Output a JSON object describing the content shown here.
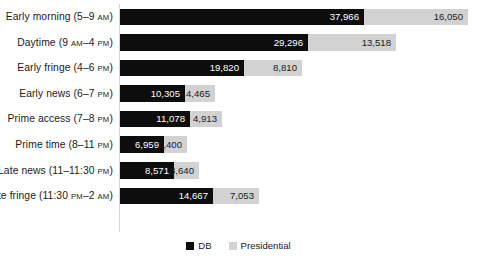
{
  "chart_data": {
    "type": "bar",
    "orientation": "horizontal",
    "stacked": true,
    "title": "",
    "xlabel": "",
    "ylabel": "",
    "grid": false,
    "legend_position": "bottom",
    "categories": [
      "Early morning (5–9 AM)",
      "Daytime (9 AM–4 PM)",
      "Early fringe (4–6 PM)",
      "Early news (6–7 PM)",
      "Prime access (7–8 PM)",
      "Prime time (8–11 PM)",
      "Late news (11–11:30 PM)",
      "Late fringe (11:30 PM–2 AM)"
    ],
    "series": [
      {
        "name": "DB",
        "color": "#0d0d0d",
        "values": [
          37966,
          29296,
          19820,
          10305,
          11078,
          6959,
          8571,
          14667
        ],
        "labels": [
          "37,966",
          "29,296",
          "19,820",
          "10,305",
          "11,078",
          "6,959",
          "8,571",
          "14,667"
        ]
      },
      {
        "name": "Presidential",
        "color": "#d2d2d2",
        "values": [
          16050,
          13518,
          8810,
          4465,
          4913,
          3400,
          3640,
          7053
        ],
        "labels": [
          "16,050",
          "13,518",
          "8,810",
          "4,465",
          "4,913",
          "3,400",
          "3,640",
          "7,053"
        ]
      }
    ],
    "xlim": [
      0,
      56000
    ]
  },
  "rows": [
    {
      "label_main": "Early morning (5–9 ",
      "label_mer": "AM",
      "label_tail": ")",
      "db_label": "37,966",
      "pres_label": "16,050",
      "db_px": 244,
      "pres_px": 104,
      "db_inside": true,
      "pres_inside": true
    },
    {
      "label_main": "Daytime (9 ",
      "label_mer": "AM",
      "label_tail": "–4 ",
      "label_mer2": "PM",
      "label_tail2": ")",
      "db_label": "29,296",
      "pres_label": "13,518",
      "db_px": 188,
      "pres_px": 88,
      "db_inside": true,
      "pres_inside": true
    },
    {
      "label_main": "Early fringe (4–6 ",
      "label_mer": "PM",
      "label_tail": ")",
      "db_label": "19,820",
      "pres_label": "8,810",
      "db_px": 124,
      "pres_px": 58,
      "db_inside": true,
      "pres_inside": true
    },
    {
      "label_main": "Early news (6–7 ",
      "label_mer": "PM",
      "label_tail": ")",
      "db_label": "10,305",
      "pres_label": "4,465",
      "db_px": 65,
      "pres_px": 30,
      "db_inside": true,
      "pres_inside": true
    },
    {
      "label_main": "Prime access (7–8 ",
      "label_mer": "PM",
      "label_tail": ")",
      "db_label": "11,078",
      "pres_label": "4,913",
      "db_px": 70,
      "pres_px": 32,
      "db_inside": true,
      "pres_inside": true
    },
    {
      "label_main": "Prime time (8–11 ",
      "label_mer": "PM",
      "label_tail": ")",
      "db_label": "6,959",
      "pres_label": "3,400",
      "db_px": 44,
      "pres_px": 23,
      "db_inside": true,
      "pres_inside": true
    },
    {
      "label_main": "Late news (11–11:30 ",
      "label_mer": "PM",
      "label_tail": ")",
      "db_label": "8,571",
      "pres_label": "3,640",
      "db_px": 54,
      "pres_px": 25,
      "db_inside": true,
      "pres_inside": true
    },
    {
      "label_main": "Late fringe (11:30 ",
      "label_mer": "PM",
      "label_tail": "–2 ",
      "label_mer2": "AM",
      "label_tail2": ")",
      "db_label": "14,667",
      "pres_label": "7,053",
      "db_px": 93,
      "pres_px": 46,
      "db_inside": true,
      "pres_inside": true
    }
  ],
  "legend": {
    "items": [
      {
        "label": "DB",
        "color": "#0d0d0d"
      },
      {
        "label": "Presidential",
        "color": "#d2d2d2"
      }
    ]
  }
}
